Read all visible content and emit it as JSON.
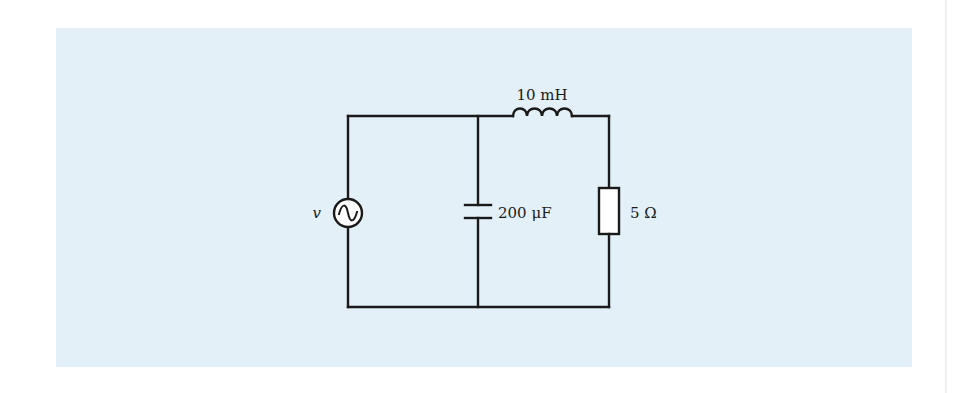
{
  "diagram": {
    "type": "circuit",
    "background_color": "#e3f0f8",
    "wire_color": "#1a1a1a",
    "components": [
      {
        "id": "source",
        "kind": "ac-voltage-source",
        "label": "v"
      },
      {
        "id": "capacitor",
        "kind": "capacitor",
        "label": "200 μF"
      },
      {
        "id": "inductor",
        "kind": "inductor",
        "label": "10 mH"
      },
      {
        "id": "resistor",
        "kind": "resistor",
        "label": "5 Ω"
      }
    ],
    "labels": {
      "source": "v",
      "capacitor": "200 μF",
      "inductor": "10 mH",
      "resistor": "5 Ω"
    }
  }
}
